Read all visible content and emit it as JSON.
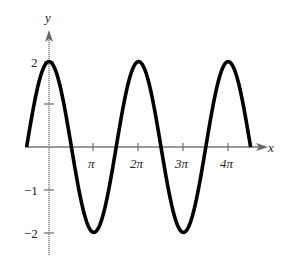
{
  "chart_data": {
    "type": "line",
    "title": "",
    "function": "y = 2cos(x)",
    "xlabel": "x",
    "ylabel": "y",
    "x_range": [
      -1.5708,
      14.1372
    ],
    "xlim": [
      -1.5708,
      15.2
    ],
    "ylim": [
      -2.6,
      2.9
    ],
    "x_ticks": [
      "π",
      "2π",
      "3π",
      "4π"
    ],
    "x_tick_values": [
      3.14159,
      6.28319,
      9.42478,
      12.56637
    ],
    "y_ticks": [
      "2",
      "-1",
      "-2"
    ],
    "y_tick_values": [
      2,
      1,
      -1,
      -2
    ],
    "grid": false,
    "series": [
      {
        "name": "2cos(x)",
        "x": [
          -1.5708,
          0,
          1.5708,
          3.1416,
          4.7124,
          6.2832,
          7.854,
          9.4248,
          10.9956,
          12.5664,
          14.1372
        ],
        "y": [
          0,
          2,
          0,
          -2,
          0,
          2,
          0,
          -2,
          0,
          2,
          0
        ]
      }
    ],
    "colors": {
      "curve": "#000000",
      "axis": "#777777",
      "text": "#222222"
    }
  },
  "labels": {
    "x_axis": "x",
    "y_axis": "y",
    "tick_pi": "π",
    "tick_2pi": "2π",
    "tick_3pi": "3π",
    "tick_4pi": "4π",
    "tick_2": "2",
    "tick_neg1": "−1",
    "tick_neg2": "−2"
  }
}
